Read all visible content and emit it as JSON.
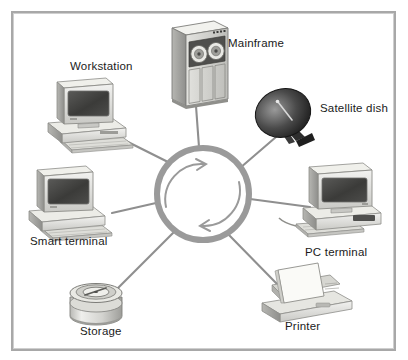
{
  "diagram": {
    "type": "network-topology",
    "background_color": "#ffffff",
    "frame_color": "#a8a8a8",
    "line_color": "#8f8f8f",
    "ring": {
      "name": "network-ring-hub",
      "center_x": 203,
      "center_y": 194,
      "radius": 46,
      "stroke_width": 6,
      "stroke_color": "#9a9a9a",
      "flow_arrows": 2,
      "flow_direction": "counterclockwise"
    },
    "nodes": [
      {
        "id": "workstation",
        "label": "Workstation",
        "icon": "desktop-computer-icon",
        "x": 84,
        "y": 108,
        "label_x": 70,
        "label_y": 60
      },
      {
        "id": "mainframe",
        "label": "Mainframe",
        "icon": "mainframe-cabinet-icon",
        "x": 194,
        "y": 63,
        "label_x": 228,
        "label_y": 37
      },
      {
        "id": "satellite-dish",
        "label": "Satellite dish",
        "icon": "satellite-dish-icon",
        "x": 286,
        "y": 115,
        "label_x": 320,
        "label_y": 102
      },
      {
        "id": "pc-terminal",
        "label": "PC terminal",
        "icon": "desktop-computer-icon",
        "x": 338,
        "y": 206,
        "label_x": 305,
        "label_y": 246
      },
      {
        "id": "printer",
        "label": "Printer",
        "icon": "printer-icon",
        "x": 298,
        "y": 295,
        "label_x": 285,
        "label_y": 320
      },
      {
        "id": "storage",
        "label": "Storage",
        "icon": "disk-pack-icon",
        "x": 96,
        "y": 300,
        "label_x": 80,
        "label_y": 325
      },
      {
        "id": "smart-terminal",
        "label": "Smart terminal",
        "icon": "desktop-computer-icon",
        "x": 72,
        "y": 200,
        "label_x": 30,
        "label_y": 235
      }
    ],
    "links": [
      {
        "from": "workstation",
        "to": "ring"
      },
      {
        "from": "mainframe",
        "to": "ring"
      },
      {
        "from": "satellite-dish",
        "to": "ring"
      },
      {
        "from": "pc-terminal",
        "to": "ring"
      },
      {
        "from": "printer",
        "to": "ring"
      },
      {
        "from": "storage",
        "to": "ring"
      },
      {
        "from": "smart-terminal",
        "to": "ring"
      }
    ]
  }
}
